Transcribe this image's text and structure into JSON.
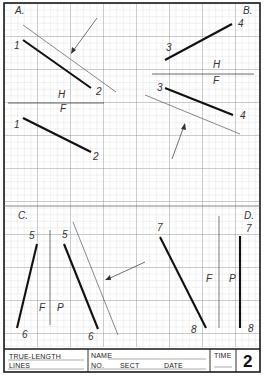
{
  "worksheet": {
    "sheet_number": "2",
    "title_block": {
      "title_line1": "TRUE-LENGTH",
      "title_line2": "LINES",
      "name_label": "NAME",
      "no_label": "NO.",
      "sect_label": "SECT",
      "date_label": "DATE",
      "time_label": "TIME"
    },
    "problems": {
      "a": {
        "label": "A.",
        "planes": {
          "top": "H",
          "bottom": "F"
        },
        "points": {
          "p1_top": "1",
          "p2_top": "2",
          "p1_bottom": "1",
          "p2_bottom": "2"
        }
      },
      "b": {
        "label": "B.",
        "planes": {
          "top": "H",
          "bottom": "F"
        },
        "points": {
          "p3_top": "3",
          "p4_top": "4",
          "p3_bottom": "3",
          "p4_bottom": "4"
        }
      },
      "c": {
        "label": "C.",
        "planes": {
          "left": "F",
          "right": "P"
        },
        "points": {
          "p5_left": "5",
          "p6_left": "6",
          "p5_right": "5",
          "p6_right": "6"
        }
      },
      "d": {
        "label": "D.",
        "planes": {
          "left": "F",
          "right": "P"
        },
        "points": {
          "p7_left": "7",
          "p8_left": "8",
          "p7_right": "7",
          "p8_right": "8"
        }
      }
    },
    "colors": {
      "grid_line": "#b8b8b8",
      "frame": "#1a1a1a",
      "line_work": "#111111"
    }
  }
}
